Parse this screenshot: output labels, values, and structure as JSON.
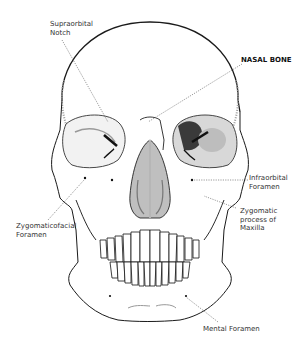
{
  "diagram": {
    "highlight_label": "NASAL BONE",
    "labels": [
      {
        "id": "supraorbital-notch",
        "text": "Supraorbital\nNotch",
        "x": 50,
        "y": 20,
        "bold": false
      },
      {
        "id": "nasal-bone",
        "text": "NASAL BONE",
        "x": 241,
        "y": 56,
        "bold": true
      },
      {
        "id": "infraorbital-foramen",
        "text": "Infraorbital\nForamen",
        "x": 249,
        "y": 174,
        "bold": false
      },
      {
        "id": "zygomaticofacial-foramen",
        "text": "Zygomaticofacial\nForamen",
        "x": 16,
        "y": 222,
        "bold": false
      },
      {
        "id": "zygomatic-process-maxilla",
        "text": "Zygomatic\nprocess of\nMaxilla",
        "x": 240,
        "y": 207,
        "bold": false
      },
      {
        "id": "mental-foramen",
        "text": "Mental Foramen",
        "x": 203,
        "y": 325,
        "bold": false
      }
    ],
    "colors": {
      "line": "#1a1a1a",
      "leader": "#555555",
      "shading": "#888888",
      "highlight": "#2b2b2b",
      "text": "#333333"
    }
  }
}
